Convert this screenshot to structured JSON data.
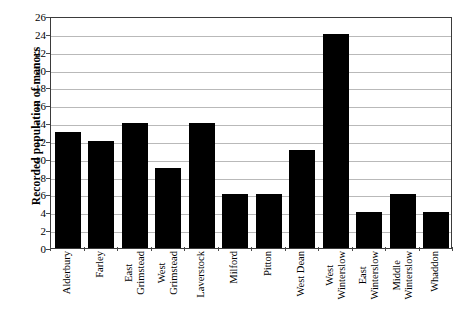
{
  "chart_data": {
    "type": "bar",
    "title": "",
    "xlabel": "",
    "ylabel": "Recorded population of manors",
    "ylim": [
      0,
      26
    ],
    "ytick_step": 2,
    "yticks": [
      0,
      2,
      4,
      6,
      8,
      10,
      12,
      14,
      16,
      18,
      20,
      22,
      24,
      26
    ],
    "grid": true,
    "legend": "none",
    "bar_color": "#000000",
    "gridline_color": "#b9b9b9",
    "axis_color": "#3b3b3b",
    "categories": [
      "Alderbury",
      "Farley",
      "East Grimstead",
      "West Grimstead",
      "Laverstock",
      "Milford",
      "Pitton",
      "West Dean",
      "West Winterslow",
      "East Winterslow",
      "Middle Winterslow",
      "Whaddon"
    ],
    "category_lines": [
      [
        "Alderbury"
      ],
      [
        "Farley"
      ],
      [
        "East",
        "Grimstead"
      ],
      [
        "West",
        "Grimstead"
      ],
      [
        "Laverstock"
      ],
      [
        "Milford"
      ],
      [
        "Pitton"
      ],
      [
        "West Dean"
      ],
      [
        "West",
        "Winterslow"
      ],
      [
        "East",
        "Winterslow"
      ],
      [
        "Middle",
        "Winterslow"
      ],
      [
        "Whaddon"
      ]
    ],
    "values": [
      13,
      12,
      14,
      9,
      14,
      6,
      6,
      11,
      24,
      4,
      6,
      4
    ]
  }
}
